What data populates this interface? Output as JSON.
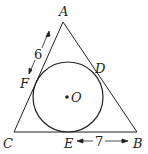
{
  "figure": {
    "type": "triangle-with-incircle",
    "vertices": {
      "A": "A",
      "B": "B",
      "C": "C"
    },
    "tangent_points": {
      "D": "D",
      "E": "E",
      "F": "F"
    },
    "center": "O",
    "measurements": {
      "AF": "6",
      "EB": "7"
    },
    "colors": {
      "stroke": "#231f20",
      "background": "#ffffff"
    }
  }
}
